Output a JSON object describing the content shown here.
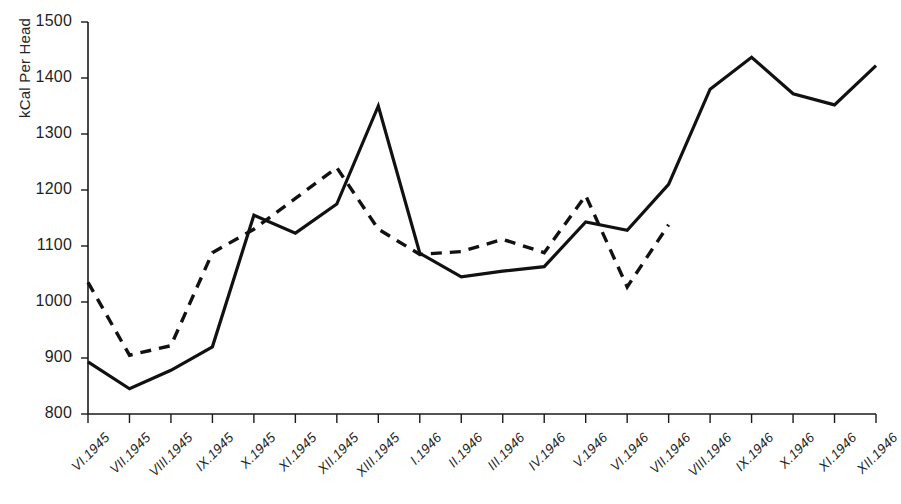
{
  "chart_data": {
    "type": "line",
    "title": "",
    "xlabel": "",
    "ylabel": "kCal Per Head",
    "ylim": [
      800,
      1500
    ],
    "yticks": [
      800,
      900,
      1000,
      1100,
      1200,
      1300,
      1400,
      1500
    ],
    "grid": false,
    "legend_position": "none",
    "categories": [
      "VI.1945",
      "VII.1945",
      "VIII.1945",
      "IX.1945",
      "X.1945",
      "XI.1945",
      "XII.1945",
      "XIII.1945",
      "I.1946",
      "II.1946",
      "III.1946",
      "IV.1946",
      "V.1946",
      "VI.1946",
      "VII.1946",
      "VIII.1946",
      "IX.1946",
      "X.1946",
      "XI.1946",
      "XII.1946"
    ],
    "series": [
      {
        "name": "solid-series",
        "style": "solid",
        "color": "#111111",
        "values": [
          893,
          845,
          878,
          920,
          1155,
          1123,
          1175,
          1350,
          1087,
          1045,
          1055,
          1063,
          1143,
          1128,
          1210,
          1380,
          1437,
          1372,
          1352,
          1422
        ]
      },
      {
        "name": "dashed-series",
        "style": "dashed",
        "color": "#111111",
        "values": [
          1035,
          905,
          922,
          1088,
          1130,
          1185,
          1240,
          1130,
          1085,
          1090,
          1112,
          1088,
          1190,
          1027,
          1138,
          null,
          null,
          null,
          null,
          null
        ]
      }
    ]
  },
  "axis": {
    "y_axis_name": "y-axis",
    "x_axis_name": "x-axis"
  }
}
